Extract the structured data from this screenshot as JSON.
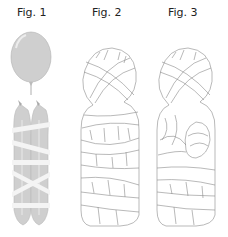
{
  "figures": [
    {
      "label": "Fig. 1",
      "description": "Inflated balloon above two long balloons wrapped with white strips"
    },
    {
      "label": "Fig. 2",
      "description": "Figure fully wrapped in overlapping bandage strips (line drawing)"
    },
    {
      "label": "Fig. 3",
      "description": "Wrapped figure with folded arm detail (line drawing)"
    }
  ],
  "colors": {
    "balloon": "#cfcfcf",
    "balloon_shade": "#b8b8b8",
    "strip": "#f4f4f4",
    "line": "#8a8a8a",
    "text": "#222222"
  }
}
